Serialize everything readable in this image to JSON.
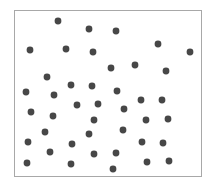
{
  "chart_data": {
    "type": "scatter",
    "title": "",
    "xlabel": "",
    "ylabel": "",
    "grid": false,
    "legend": "none",
    "xlim": [
      0,
      188
    ],
    "ylim": [
      0,
      167
    ],
    "marker_color": "#474747",
    "frame_color": "#a8a8a8",
    "points": [
      {
        "x": 44,
        "y": 156
      },
      {
        "x": 75,
        "y": 148
      },
      {
        "x": 102,
        "y": 146
      },
      {
        "x": 16,
        "y": 127
      },
      {
        "x": 52,
        "y": 128
      },
      {
        "x": 79,
        "y": 125
      },
      {
        "x": 144,
        "y": 133
      },
      {
        "x": 176,
        "y": 125
      },
      {
        "x": 97,
        "y": 109
      },
      {
        "x": 121,
        "y": 112
      },
      {
        "x": 152,
        "y": 106
      },
      {
        "x": 33,
        "y": 100
      },
      {
        "x": 12,
        "y": 85
      },
      {
        "x": 57,
        "y": 92
      },
      {
        "x": 78,
        "y": 91
      },
      {
        "x": 40,
        "y": 82
      },
      {
        "x": 103,
        "y": 86
      },
      {
        "x": 127,
        "y": 77
      },
      {
        "x": 148,
        "y": 77
      },
      {
        "x": 17,
        "y": 65
      },
      {
        "x": 63,
        "y": 72
      },
      {
        "x": 84,
        "y": 73
      },
      {
        "x": 110,
        "y": 68
      },
      {
        "x": 39,
        "y": 61
      },
      {
        "x": 80,
        "y": 57
      },
      {
        "x": 132,
        "y": 57
      },
      {
        "x": 154,
        "y": 58
      },
      {
        "x": 31,
        "y": 45
      },
      {
        "x": 75,
        "y": 43
      },
      {
        "x": 109,
        "y": 47
      },
      {
        "x": 14,
        "y": 35
      },
      {
        "x": 58,
        "y": 33
      },
      {
        "x": 128,
        "y": 35
      },
      {
        "x": 149,
        "y": 34
      },
      {
        "x": 36,
        "y": 25
      },
      {
        "x": 80,
        "y": 23
      },
      {
        "x": 102,
        "y": 24
      },
      {
        "x": 13,
        "y": 14
      },
      {
        "x": 57,
        "y": 13
      },
      {
        "x": 99,
        "y": 8
      },
      {
        "x": 133,
        "y": 15
      },
      {
        "x": 155,
        "y": 16
      }
    ]
  }
}
